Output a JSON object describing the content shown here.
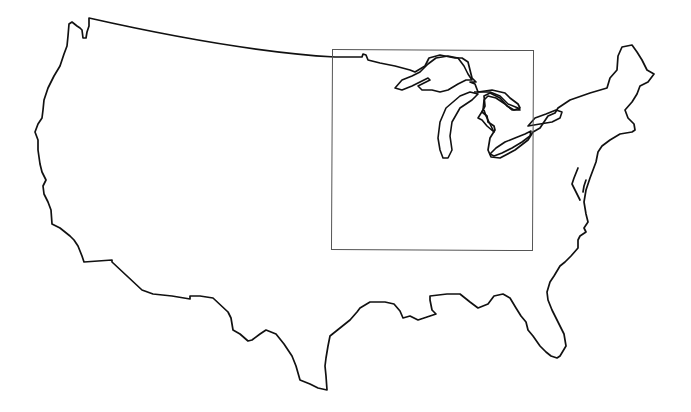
{
  "map": {
    "subject": "Contiguous United States outline",
    "highlight_region": {
      "label": "",
      "description": "Rectangle around the Great Lakes / Midwest region",
      "x": 332,
      "y": 50,
      "width": 201,
      "height": 200
    },
    "colors": {
      "background": "#ffffff",
      "outline": "#111111",
      "box": "#555555"
    }
  }
}
